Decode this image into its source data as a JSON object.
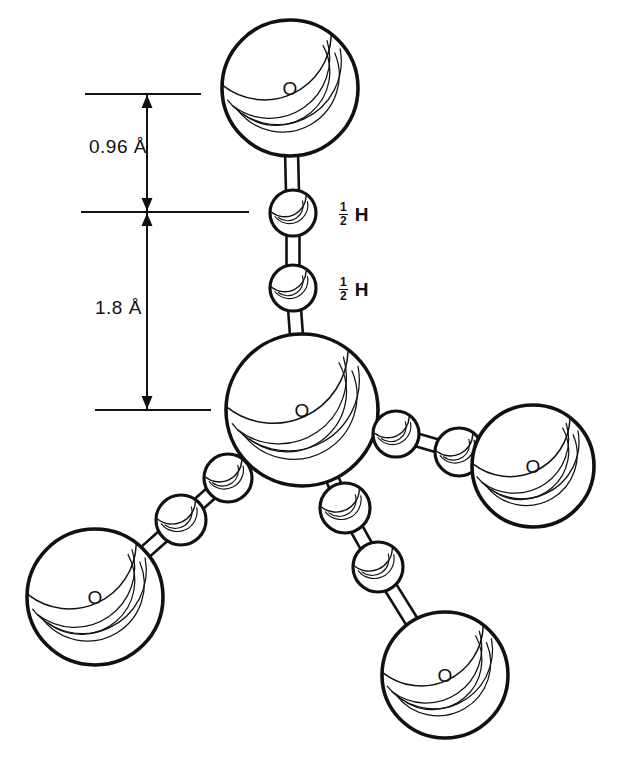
{
  "figure": {
    "type": "ball-and-stick molecular diagram",
    "background_color": "#ffffff",
    "line_color": "#111111"
  },
  "dimensions": [
    {
      "id": "covalent-bond",
      "label": "0.96 Å",
      "value": 0.96,
      "unit": "Å",
      "description": "O–H covalent bond length",
      "label_x": 89,
      "label_y": 136,
      "top_tick": {
        "y": 94,
        "x1": 85,
        "x2": 201
      },
      "bottom_tick": {
        "y": 212,
        "x1": 81,
        "x2": 249
      },
      "arrow_x": 147
    },
    {
      "id": "hydrogen-bond",
      "label": "1.8 Å",
      "value": 1.8,
      "unit": "Å",
      "description": "H···O hydrogen bond distance",
      "label_x": 95,
      "label_y": 297,
      "top_tick": {
        "y": 212,
        "x1": 81,
        "x2": 249
      },
      "bottom_tick": {
        "y": 410,
        "x1": 95,
        "x2": 211
      },
      "arrow_x": 147
    }
  ],
  "hydrogen_labels": [
    {
      "numerator": "1",
      "denominator": "2",
      "symbol": "H",
      "x": 339,
      "y": 202,
      "occupancy": 0.5
    },
    {
      "numerator": "1",
      "denominator": "2",
      "symbol": "H",
      "x": 339,
      "y": 277,
      "occupancy": 0.5
    }
  ],
  "atoms": [
    {
      "id": "O-top",
      "element": "O",
      "label": "O",
      "cx": 290,
      "cy": 88,
      "r": 68,
      "role": "oxygen-upper"
    },
    {
      "id": "H-upper",
      "element": "H",
      "label": "",
      "cx": 293,
      "cy": 213,
      "r": 23,
      "role": "hydrogen-half-occupancy"
    },
    {
      "id": "H-lower",
      "element": "H",
      "label": "",
      "cx": 293,
      "cy": 288,
      "r": 23,
      "role": "hydrogen-half-occupancy"
    },
    {
      "id": "O-center",
      "element": "O",
      "label": "O",
      "cx": 302,
      "cy": 410,
      "r": 76,
      "role": "oxygen-central"
    },
    {
      "id": "H-right-in",
      "element": "H",
      "label": "",
      "cx": 396,
      "cy": 434,
      "r": 23,
      "role": "hydrogen"
    },
    {
      "id": "H-right-out",
      "element": "H",
      "label": "",
      "cx": 459,
      "cy": 452,
      "r": 24,
      "role": "hydrogen"
    },
    {
      "id": "O-right",
      "element": "O",
      "label": "O",
      "cx": 533,
      "cy": 466,
      "r": 61,
      "role": "oxygen-right"
    },
    {
      "id": "H-left-in",
      "element": "H",
      "label": "",
      "cx": 228,
      "cy": 478,
      "r": 24,
      "role": "hydrogen"
    },
    {
      "id": "H-left-out",
      "element": "H",
      "label": "",
      "cx": 181,
      "cy": 520,
      "r": 25,
      "role": "hydrogen"
    },
    {
      "id": "O-left",
      "element": "O",
      "label": "O",
      "cx": 95,
      "cy": 597,
      "r": 68,
      "role": "oxygen-lower-left"
    },
    {
      "id": "H-bot-in",
      "element": "H",
      "label": "",
      "cx": 345,
      "cy": 508,
      "r": 25,
      "role": "hydrogen"
    },
    {
      "id": "H-bot-out",
      "element": "H",
      "label": "",
      "cx": 378,
      "cy": 567,
      "r": 25,
      "role": "hydrogen"
    },
    {
      "id": "O-bottom",
      "element": "O",
      "label": "O",
      "cx": 445,
      "cy": 675,
      "r": 63,
      "role": "oxygen-bottom"
    }
  ],
  "bonds": [
    {
      "from": "O-top",
      "to": "H-upper",
      "kind": "covalent"
    },
    {
      "from": "H-upper",
      "to": "H-lower",
      "kind": "hydrogen"
    },
    {
      "from": "H-lower",
      "to": "O-center",
      "kind": "hydrogen"
    },
    {
      "from": "O-center",
      "to": "H-right-in",
      "kind": "covalent"
    },
    {
      "from": "H-right-in",
      "to": "H-right-out",
      "kind": "hydrogen"
    },
    {
      "from": "H-right-out",
      "to": "O-right",
      "kind": "hydrogen"
    },
    {
      "from": "O-center",
      "to": "H-left-in",
      "kind": "covalent"
    },
    {
      "from": "H-left-in",
      "to": "H-left-out",
      "kind": "hydrogen"
    },
    {
      "from": "H-left-out",
      "to": "O-left",
      "kind": "hydrogen"
    },
    {
      "from": "O-center",
      "to": "H-bot-in",
      "kind": "covalent"
    },
    {
      "from": "H-bot-in",
      "to": "H-bot-out",
      "kind": "hydrogen"
    },
    {
      "from": "H-bot-out",
      "to": "O-bottom",
      "kind": "hydrogen"
    }
  ]
}
